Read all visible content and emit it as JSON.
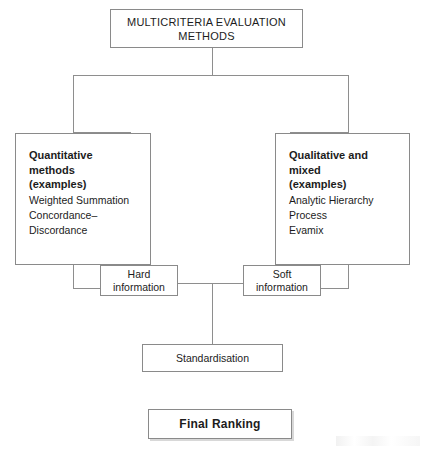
{
  "diagram": {
    "title": "MULTICRITERIA EVALUATION METHODS",
    "root": {
      "line1": "MULTICRITERIA EVALUATION",
      "line2": "METHODS"
    },
    "quantitative": {
      "title_line1": "Quantitative methods",
      "title_line2": "(examples)",
      "items": [
        "Weighted Summation",
        "Concordance–",
        "Discordance"
      ]
    },
    "qualitative": {
      "title_line1": "Qualitative and mixed",
      "title_line2": "(examples)",
      "items": [
        "Analytic Hierarchy",
        "Process",
        "Evamix"
      ]
    },
    "hard_information": {
      "line1": "Hard",
      "line2": "information"
    },
    "soft_information": {
      "line1": "Soft",
      "line2": "information"
    },
    "standardisation": {
      "label": "Standardisation"
    },
    "final_ranking": {
      "label": "Final Ranking"
    },
    "colors": {
      "line": "#8e8e8e",
      "box_border": "#8a8a8a",
      "text": "#1c1c1c",
      "background": "#ffffff",
      "shadow": "#d8d8d8"
    }
  }
}
